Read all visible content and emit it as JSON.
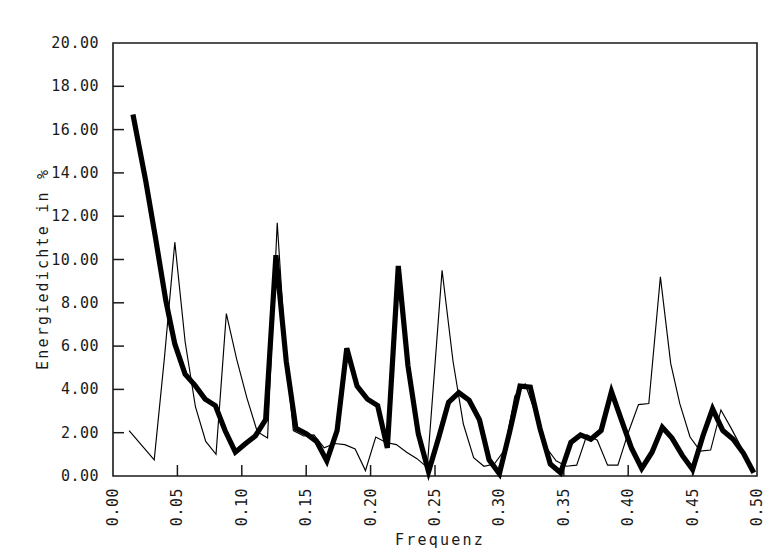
{
  "chart_data": {
    "type": "line",
    "title": "",
    "xlabel": "Frequenz",
    "ylabel": "Energiedichte in %",
    "xlim": [
      0.0,
      0.5
    ],
    "ylim": [
      0.0,
      20.0
    ],
    "grid": false,
    "legend": "none",
    "x_ticks": [
      "0.00",
      "0.05",
      "0.10",
      "0.15",
      "0.20",
      "0.25",
      "0.30",
      "0.35",
      "0.40",
      "0.45",
      "0.50"
    ],
    "x_tick_values": [
      0.0,
      0.05,
      0.1,
      0.15,
      0.2,
      0.25,
      0.3,
      0.35,
      0.4,
      0.45,
      0.5
    ],
    "y_ticks": [
      "0.00",
      "2.00",
      "4.00",
      "6.00",
      "8.00",
      "10.00",
      "12.00",
      "14.00",
      "16.00",
      "18.00",
      "20.00"
    ],
    "y_tick_values": [
      0,
      2,
      4,
      6,
      8,
      10,
      12,
      14,
      16,
      18,
      20
    ],
    "series": [
      {
        "name": "thick-series",
        "style": "thick",
        "color": "#000000",
        "width": 5.2,
        "x": [
          0.0155,
          0.0255,
          0.033,
          0.041,
          0.048,
          0.056,
          0.0635,
          0.0715,
          0.0795,
          0.087,
          0.095,
          0.103,
          0.1105,
          0.1185,
          0.1265,
          0.1345,
          0.142,
          0.15,
          0.158,
          0.166,
          0.174,
          0.1815,
          0.1895,
          0.1975,
          0.2055,
          0.213,
          0.2215,
          0.229,
          0.237,
          0.245,
          0.253,
          0.2605,
          0.2685,
          0.2765,
          0.2845,
          0.292,
          0.3,
          0.308,
          0.316,
          0.324,
          0.3315,
          0.3395,
          0.3475,
          0.3555,
          0.363,
          0.371,
          0.379,
          0.387,
          0.395,
          0.4025,
          0.4105,
          0.4185,
          0.4265,
          0.434,
          0.442,
          0.45,
          0.458,
          0.4655,
          0.4735,
          0.4815,
          0.4895,
          0.4975
        ],
        "y": [
          16.7,
          13.6,
          11.0,
          8.1,
          6.1,
          4.7,
          4.2,
          3.55,
          3.25,
          2.1,
          1.1,
          1.5,
          1.85,
          2.6,
          10.2,
          5.3,
          2.2,
          1.95,
          1.6,
          0.7,
          2.1,
          5.9,
          4.15,
          3.55,
          3.25,
          1.3,
          9.7,
          5.1,
          1.95,
          0.2,
          1.8,
          3.4,
          3.85,
          3.5,
          2.6,
          0.75,
          0.1,
          2.05,
          4.15,
          4.1,
          2.2,
          0.55,
          0.15,
          1.55,
          1.9,
          1.7,
          2.1,
          3.9,
          2.55,
          1.3,
          0.35,
          1.1,
          2.25,
          1.75,
          0.95,
          0.3,
          1.85,
          3.1,
          2.1,
          1.7,
          1.05,
          0.15
        ]
      },
      {
        "name": "thin-series",
        "style": "thin",
        "color": "#000000",
        "width": 1.15,
        "x": [
          0.0125,
          0.032,
          0.04,
          0.048,
          0.056,
          0.064,
          0.072,
          0.08,
          0.088,
          0.096,
          0.104,
          0.112,
          0.12,
          0.1275,
          0.134,
          0.14,
          0.148,
          0.156,
          0.164,
          0.172,
          0.18,
          0.188,
          0.196,
          0.204,
          0.212,
          0.22,
          0.228,
          0.236,
          0.244,
          0.2555,
          0.264,
          0.272,
          0.28,
          0.288,
          0.296,
          0.304,
          0.312,
          0.32,
          0.328,
          0.336,
          0.344,
          0.352,
          0.36,
          0.368,
          0.376,
          0.384,
          0.392,
          0.4,
          0.408,
          0.416,
          0.425,
          0.433,
          0.44,
          0.448,
          0.456,
          0.464,
          0.472,
          0.48,
          0.488,
          0.4975
        ],
        "y": [
          2.1,
          0.75,
          5.5,
          10.8,
          6.2,
          3.2,
          1.6,
          1.0,
          7.5,
          5.4,
          3.6,
          2.05,
          1.75,
          11.7,
          5.7,
          2.1,
          1.85,
          1.9,
          1.3,
          1.5,
          1.45,
          1.25,
          0.25,
          1.8,
          1.55,
          1.45,
          1.1,
          0.8,
          0.4,
          9.5,
          5.3,
          2.4,
          0.85,
          0.45,
          0.55,
          1.2,
          3.7,
          4.25,
          2.9,
          1.35,
          0.7,
          0.45,
          0.5,
          1.9,
          1.65,
          0.5,
          0.5,
          2.0,
          3.3,
          3.35,
          9.2,
          5.2,
          3.35,
          1.8,
          1.15,
          1.2,
          3.05,
          2.2,
          1.3,
          0.25
        ]
      }
    ]
  },
  "plot": {
    "left_px": 113,
    "top_px": 43,
    "right_px": 757,
    "bottom_px": 476
  }
}
